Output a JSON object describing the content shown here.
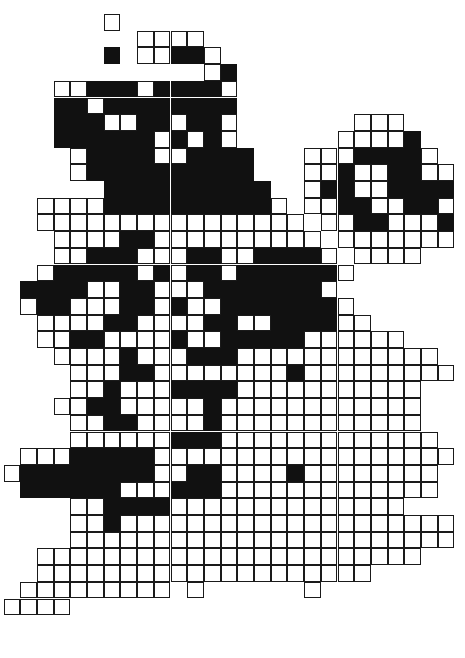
{
  "figure": {
    "name": "british-isles-distribution-map",
    "kind": "dot-distribution grid map",
    "region": "British Isles",
    "background_color": "#ffffff",
    "outline_color": "#1a1a1a",
    "filled_color": "#111111",
    "empty_color": "#ffffff"
  },
  "legend": {
    "filled_meaning": "present",
    "empty_meaning": "absent / surveyed only"
  },
  "grid": {
    "cell_size": 16.7,
    "border_width": 1.3,
    "origin_x": 3.5,
    "origin_y": 14.0,
    "columns": 27,
    "rows": 39,
    "encoding": {
      ".": "no cell (blank background)",
      "o": "empty cell (white square with outline)",
      "x": "filled cell (solid black square)"
    },
    "rows_data": [
      "......o....................",
      "........oooo...............",
      "......x.ooxxo..............",
      "............ox.............",
      "...ooxxxoxxxxo.............",
      "...xxoxxxxxxxx.............",
      "...xxxooxxoxxo.......ooo...",
      "...xxxxxxoxoxo......oooox..",
      "....oxxxxooxxxx...oooxxxxo.",
      "....oxxxxxxxxxx...ooxooxxoo",
      "......xxxxxxxxxx..oxxooxxxx",
      "..ooooxxxxxxxxxxo.ooxxooxxo",
      "..oooooooooooooooo.ooxxooox",
      "...ooooxxoooooooooo.ooooooo",
      "...ooxxxoooxxooxxxxo.oooo..",
      "..oxxxxxoxoxxoxxxxxxo......",
      ".xxxxooxxoooxxxxxxxo.......",
      ".oxxoooxxoxooxxxxxxxo......",
      "..ooooxxooooxxooxxxxoo.....",
      "..ooxxooooxooxxxxxoooooo...",
      "...ooooxoooxxxoooooooooooo.",
      "....oooxxooooooooxooooooooo",
      "....ooxoooxxxxooooooooooo..",
      "...ooxxoooooxoooooooooooo..",
      "....ooxxooooxoooooooooooo..",
      "....ooooooxxxooooooooooooo.",
      ".oooxxxxxoooooooooooooooooo",
      "oxxxxxxxxooxxooooxoooooooo.",
      ".xxxxxxoooxxxooooooooooooo.",
      "....ooxxxxoooooooooooooo...",
      "....ooxoooooooooooooooooooo",
      "....ooooooooooooooooooooooo",
      "..ooooooooooooooooooooooo..",
      "..oooooooooooooooooooo.....",
      ".ooooooooo.o......o........",
      "oooo.......................",
      "...........................",
      "...........................",
      "..........................."
    ]
  }
}
